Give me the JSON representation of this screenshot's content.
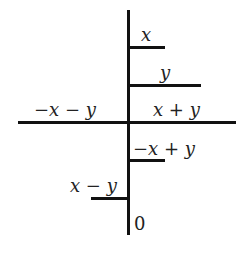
{
  "diagram": {
    "labels": {
      "x": "x",
      "y": "y",
      "neg_x_neg_y": "−x − y",
      "x_plus_y": "x + y",
      "neg_x_plus_y": "−x + y",
      "x_minus_y": "x − y",
      "zero": "0"
    },
    "line_color": "#111111"
  }
}
